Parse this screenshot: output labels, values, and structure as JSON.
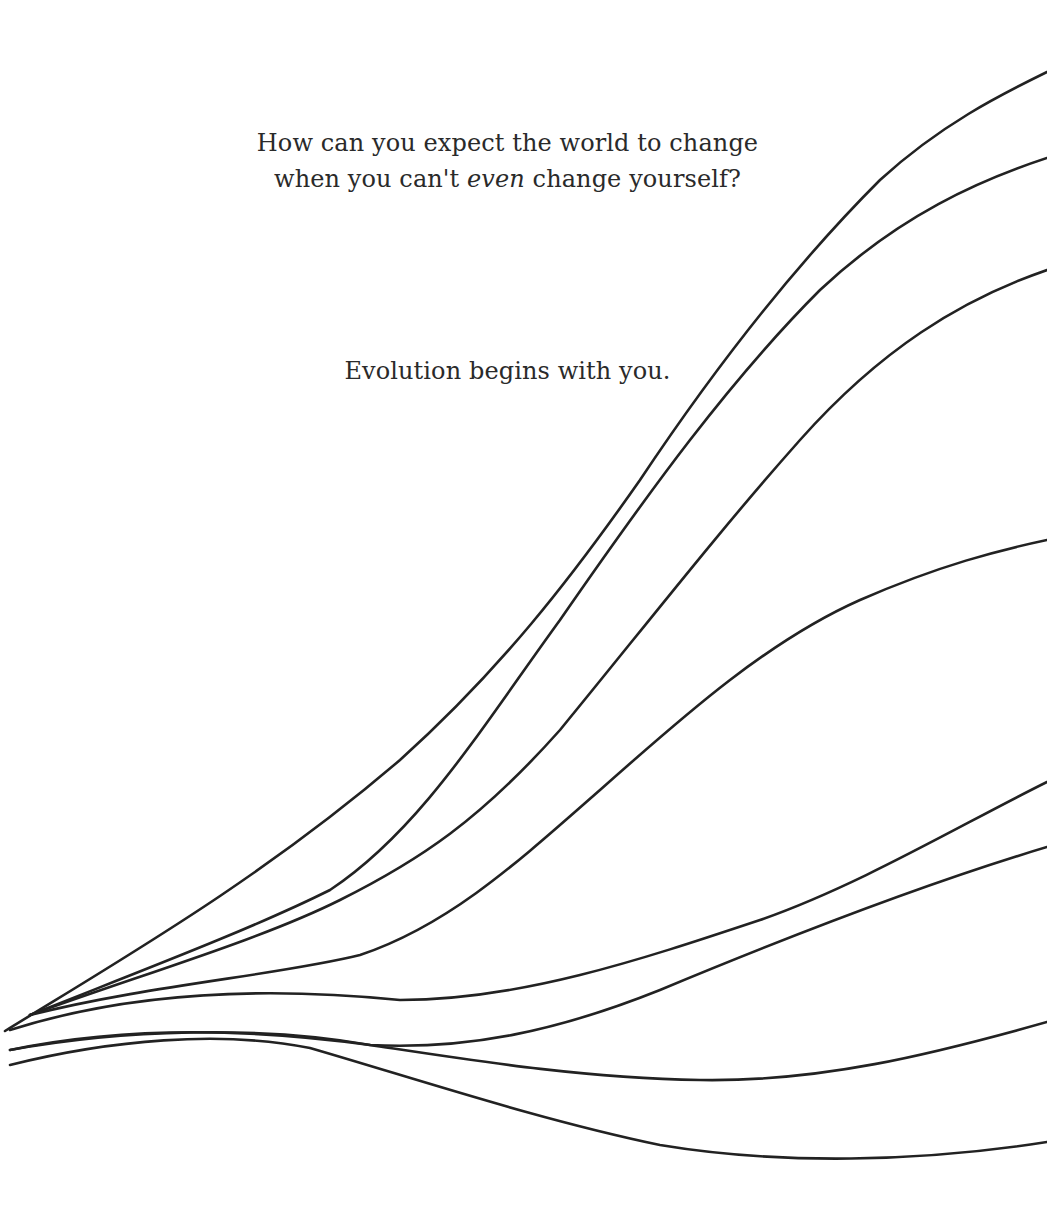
{
  "quote": {
    "line1": "How can you expect the world to change",
    "line2_before": "when you can't ",
    "line2_emphasis": "even",
    "line2_after": " change yourself?",
    "tagline": "Evolution begins with you."
  },
  "style": {
    "background": "#ffffff",
    "text_color": "#2a2a2a",
    "line_color": "#222222"
  },
  "illustration": {
    "description": "Eight branching curves that diverge from a common origin at the lower left toward the right edge",
    "line_count": 8
  }
}
